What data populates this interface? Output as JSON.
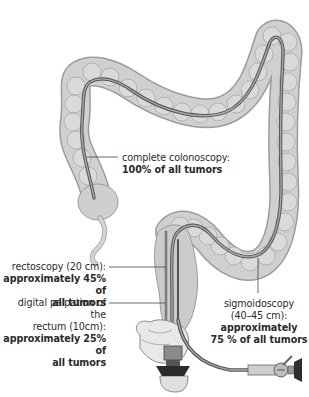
{
  "diagram": {
    "type": "medical illustration",
    "colors": {
      "colon_fill": "#c8c8c8",
      "colon_stroke": "#9a9a9a",
      "endoscope": "#6a6a6a",
      "leader_line": "#444444",
      "text": "#2a2a2a"
    },
    "labels": {
      "colonoscopy": {
        "title": "complete colonoscopy:",
        "value": "100% of all tumors"
      },
      "rectoscopy": {
        "title": "rectoscopy (20 cm):",
        "value_line1": "approximately 45% of",
        "value_line2": "all tumors"
      },
      "palpation": {
        "title_line1": "digital palpation of the",
        "title_line2": "rectum (10cm):",
        "value_line1": "approximately 25% of",
        "value_line2": "all tumors"
      },
      "sigmoidoscopy": {
        "title_line1": "sigmoidoscopy",
        "title_line2": "(40–45 cm):",
        "value_line1": "approximately",
        "value_line2": "75 % of all tumors"
      }
    }
  }
}
